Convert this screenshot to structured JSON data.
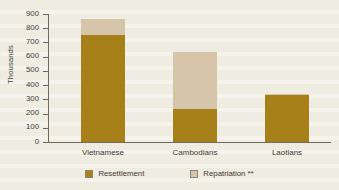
{
  "chart_data": {
    "type": "bar",
    "subtype": "stacked-vertical",
    "title": "",
    "subtitle": "",
    "xlabel": "",
    "ylabel": "Thousands",
    "categories": [
      "Vietnamese",
      "Cambodians",
      "Laotians"
    ],
    "series": [
      {
        "name": "Resettlement",
        "color": "#a8801a",
        "values": [
          750,
          235,
          330
        ]
      },
      {
        "name": "Repatriation **",
        "color": "#d6c5a8",
        "values": [
          115,
          395,
          10
        ]
      }
    ],
    "totals": [
      865,
      630,
      340
    ],
    "ylim": [
      0,
      900
    ],
    "ytick_values": [
      900,
      800,
      700,
      600,
      500,
      400,
      300,
      200,
      100,
      0
    ],
    "ytick_labels": [
      "900",
      "800",
      "700",
      "600",
      "500",
      "400",
      "300",
      "200",
      "100",
      "0"
    ],
    "grid": false,
    "legend_position": "bottom-center",
    "legend_entries": [
      "Resettlement",
      "Repatriation **"
    ],
    "annotations": [],
    "background_color": "#efece1",
    "axis_color": "#6f6a5c",
    "text_color": "#3f3b33"
  },
  "legend": {
    "items": [
      {
        "label": "Resettlement",
        "swatch": "resettlement-swatch"
      },
      {
        "label": "Repatriation **",
        "swatch": "repatriation-swatch"
      }
    ]
  },
  "axes": {
    "y_axis_title": "Thousands"
  }
}
